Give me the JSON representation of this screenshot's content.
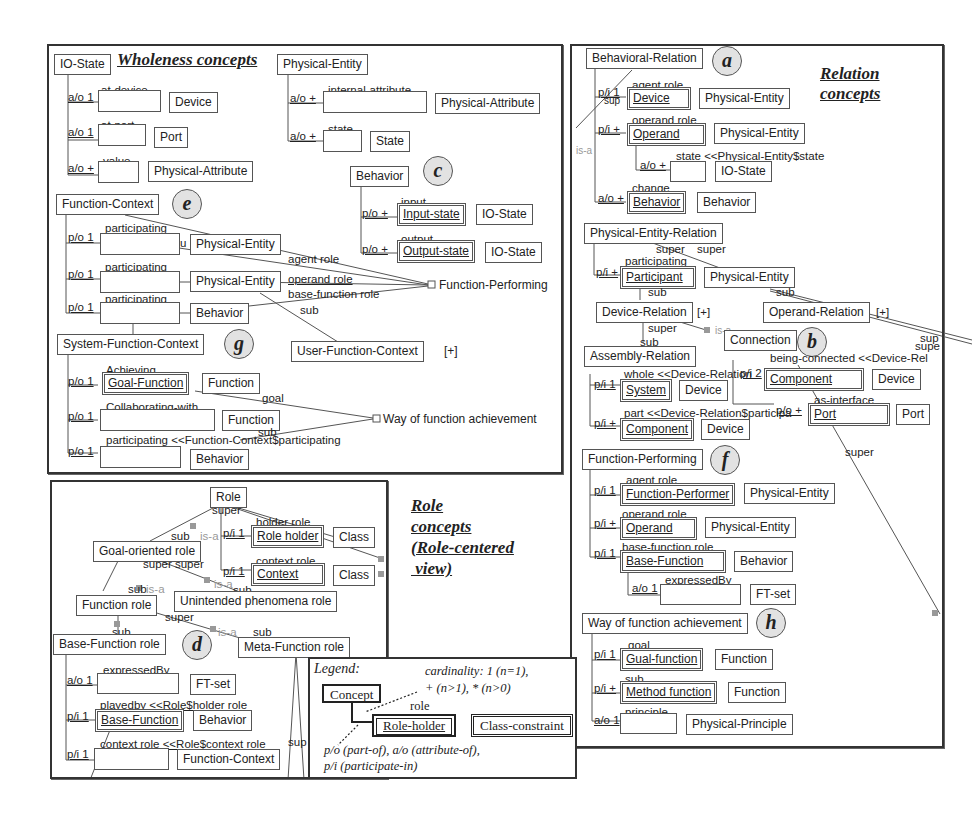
{
  "wholeness": {
    "title": "Wholeness concepts",
    "io_state": {
      "name": "IO-State",
      "slots": [
        {
          "card": "a/o 1",
          "role": "at-device",
          "cls": "Device"
        },
        {
          "card": "a/o 1",
          "role": "at-port",
          "cls": "Port"
        },
        {
          "card": "a/o +",
          "role": "value",
          "cls": "Physical-Attribute"
        }
      ]
    },
    "physical_entity": {
      "name": "Physical-Entity",
      "slots": [
        {
          "card": "a/o +",
          "role": "internal-attribute",
          "cls": "Physical-Attribute"
        },
        {
          "card": "a/o +",
          "role": "state",
          "cls": "State"
        }
      ]
    },
    "behavior": {
      "name": "Behavior",
      "marker": "c",
      "slots": [
        {
          "card": "p/o +",
          "role": "input",
          "holder": "Input-state",
          "cls": "IO-State"
        },
        {
          "card": "p/o +",
          "role": "output",
          "holder": "Output-state",
          "cls": "IO-State"
        }
      ]
    },
    "function_context": {
      "name": "Function-Context",
      "marker": "e",
      "slots": [
        {
          "card": "p/o 1",
          "role": "participating",
          "cls": "Physical-Entity"
        },
        {
          "card": "p/o 1",
          "role": "participating",
          "cls": "Physical-Entity"
        },
        {
          "card": "p/o 1",
          "role": "participating",
          "cls": "Behavior"
        }
      ],
      "stray": "u"
    },
    "links": {
      "agent_role": "agent role",
      "operand_role": "operand role",
      "base_function_role": "base-function role",
      "sub": "sub",
      "function_performing": "Function-Performing"
    },
    "user_function_context": {
      "name": "User-Function-Context",
      "expand": "[+]"
    },
    "system_function_context": {
      "name": "System-Function-Context",
      "marker": "g",
      "slots": [
        {
          "card": "p/o 1",
          "role": "Achieving",
          "holder": "Goal-Function",
          "cls": "Function"
        },
        {
          "card": "p/o 1",
          "role": "Collaborating-with",
          "cls": "Function"
        },
        {
          "card": "p/o 1",
          "role": "participating <<Function-Context$participating",
          "cls": "Behavior"
        }
      ],
      "goal": "goal",
      "sub": "sub",
      "way": "Way of function achievement"
    }
  },
  "relation": {
    "title_line1": "Relation",
    "title_line2": "concepts",
    "behavioral_relation": {
      "name": "Behavioral-Relation",
      "marker": "a",
      "isa": "is-a",
      "sup": "sup",
      "slots": [
        {
          "card": "p/i 1",
          "role": "agent role",
          "holder": "Device",
          "cls": "Physical-Entity"
        },
        {
          "card": "p/i +",
          "role": "operand role",
          "holder": "Operand",
          "cls": "Physical-Entity"
        },
        {
          "card": "a/o +",
          "role": "state <<Physical-Entity$state",
          "cls": "IO-State"
        },
        {
          "card": "a/o +",
          "role": "change",
          "holder": "Behavior",
          "cls": "Behavior"
        }
      ]
    },
    "physical_entity_relation": {
      "name": "Physical-Entity-Relation",
      "super1": "super",
      "super2": "super",
      "slot": {
        "card": "p/i +",
        "role": "participating",
        "holder": "Participant",
        "cls": "Physical-Entity"
      },
      "sub1": "sub",
      "sub2": "sub"
    },
    "device_relation": {
      "name": "Device-Relation",
      "expand": "[+]",
      "super": "super",
      "sub": "sub",
      "isa1": "is-a",
      "isa2": "is-a"
    },
    "operand_relation": {
      "name": "Operand-Relation",
      "expand": "[+]",
      "sup1": "sup",
      "sup2": "supe"
    },
    "connection": {
      "name": "Connection",
      "marker": "b",
      "slots": [
        {
          "card": "p/i 2",
          "role": "being-connected <<Device-Rel",
          "holder": "Component",
          "cls": "Device"
        },
        {
          "card": "p/o +",
          "role": "as-interface",
          "holder": "Port",
          "cls": "Port"
        }
      ],
      "super": "super"
    },
    "assembly_relation": {
      "name": "Assembly-Relation",
      "slots": [
        {
          "card": "p/i 1",
          "role": "whole <<Device-Relation",
          "holder": "System",
          "cls": "Device"
        },
        {
          "card": "p/i +",
          "role": "part <<Device-Relation$participa",
          "holder": "Component",
          "cls": "Device"
        }
      ]
    },
    "function_performing": {
      "name": "Function-Performing",
      "marker": "f",
      "slots": [
        {
          "card": "p/i 1",
          "role": "agent role",
          "holder": "Function-Performer",
          "cls": "Physical-Entity"
        },
        {
          "card": "p/i +",
          "role": "operand role",
          "holder": "Operand",
          "cls": "Physical-Entity"
        },
        {
          "card": "p/i 1",
          "role": "base-function role",
          "holder": "Base-Function",
          "cls": "Behavior"
        },
        {
          "card": "a/o 1",
          "role": "expressedBy",
          "cls": "FT-set"
        }
      ]
    },
    "way": {
      "name": "Way of function achievement",
      "marker": "h",
      "slots": [
        {
          "card": "p/i 1",
          "role": "goal",
          "holder": "Gual-function",
          "cls": "Function"
        },
        {
          "card": "p/i +",
          "role": "sub",
          "holder": "Method function",
          "cls": "Function"
        },
        {
          "card": "a/o 1",
          "role": "principle",
          "cls": "Physical-Principle"
        }
      ]
    }
  },
  "role": {
    "title_lines": [
      "Role",
      "concepts",
      "(Role-centered",
      " view)"
    ],
    "root": "Role",
    "super": "super",
    "sub": "sub",
    "isa": "is-a",
    "holder_slot": {
      "card": "p/i 1",
      "role": "holder role",
      "holder": "Role holder",
      "cls": "Class"
    },
    "context_slot": {
      "card": "p/i 1",
      "role": "context role",
      "holder": "Context",
      "cls": "Class"
    },
    "goal_oriented": "Goal-oriented role",
    "superduper": "super super",
    "function_role": "Function role",
    "unintended": "Unintended phenomena role",
    "meta_function": "Meta-Function role",
    "base_function_role": {
      "name": "Base-Function role",
      "marker": "d",
      "slots": [
        {
          "card": "a/o 1",
          "role": "expressedBy",
          "cls": "FT-set"
        },
        {
          "card": "p/i 1",
          "role": "playedby <<Role$holder role",
          "holder": "Base-Function",
          "cls": "Behavior"
        },
        {
          "card": "p/i 1",
          "role": "context role <<Role$context role",
          "cls": "Function-Context"
        }
      ]
    },
    "sup": "sup"
  },
  "legend": {
    "title": "Legend:",
    "cardinality_1": "cardinality:  1 (n=1),",
    "cardinality_2": "+ (n>1), * (n>0)",
    "concept": "Concept",
    "role": "role",
    "role_holder": "Role-holder",
    "class_constraint": "Class-constraint",
    "rel_1": "p/o (part-of), a/o (attribute-of),",
    "rel_2": "p/i (participate-in)"
  }
}
